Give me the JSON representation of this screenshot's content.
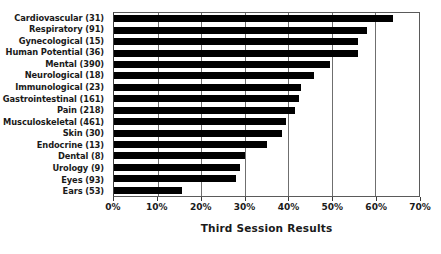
{
  "chart_data": {
    "type": "bar",
    "orientation": "horizontal",
    "title": "",
    "xlabel": "Third Session Results",
    "ylabel": "",
    "xlim": [
      0,
      70
    ],
    "xticks": [
      "0%",
      "10%",
      "20%",
      "30%",
      "40%",
      "50%",
      "60%",
      "70%"
    ],
    "xtick_values": [
      0,
      10,
      20,
      30,
      40,
      50,
      60,
      70
    ],
    "grid": true,
    "legend": false,
    "bar_color": "#000000",
    "categories": [
      "Cardiovascular (31)",
      "Respiratory (91)",
      "Gynecological (15)",
      "Human Potential (36)",
      "Mental (390)",
      "Neurological (18)",
      "Immunological (23)",
      "Gastrointestinal (161)",
      "Pain (218)",
      "Musculoskeletal (461)",
      "Skin (30)",
      "Endocrine (13)",
      "Dental (8)",
      "Urology (9)",
      "Eyes (93)",
      "Ears (53)"
    ],
    "values": [
      64,
      58,
      56,
      56,
      49.5,
      46,
      43,
      42.5,
      41.5,
      39.5,
      38.5,
      35,
      30,
      29,
      28,
      15.5
    ]
  }
}
